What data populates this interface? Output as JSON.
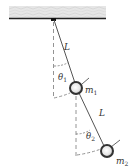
{
  "diagram": {
    "labels": {
      "rod1_length": "L",
      "rod2_length": "L",
      "angle1": "θ",
      "angle1_sub": "1",
      "angle2": "θ",
      "angle2_sub": "2",
      "mass1": "m",
      "mass1_sub": "1",
      "mass2": "m",
      "mass2_sub": "2"
    },
    "colors": {
      "ceiling": "#d9d9d9",
      "ceiling_edge": "#222222",
      "rod": "#555555",
      "dashed": "#888888",
      "mass_ring": "#333333",
      "mass_fill": "#e0e0e0"
    }
  }
}
